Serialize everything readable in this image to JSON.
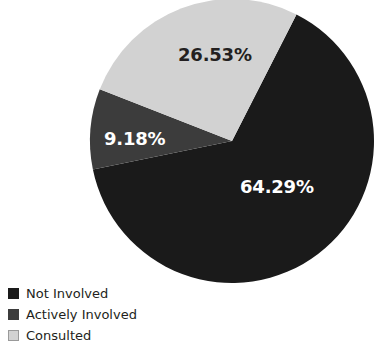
{
  "chart_data": {
    "type": "pie",
    "title": "",
    "subtitle": "",
    "xlabel": "",
    "ylabel": "",
    "grid": false,
    "legend_position": "bottom-left",
    "categories": [
      "Not Involved",
      "Actively Involved",
      "Consulted"
    ],
    "values": [
      64.29,
      9.18,
      26.53
    ],
    "value_unit": "%",
    "data_labels": [
      "64.29%",
      "9.18%",
      "26.53%"
    ],
    "slice_colors": [
      "#1a1a1a",
      "#3c3c3c",
      "#d2d2d2"
    ],
    "label_text_colors": [
      "#ffffff",
      "#ffffff",
      "#231f20"
    ],
    "slices": [
      {
        "name": "Not Involved",
        "value": 64.29,
        "label": "64.29%",
        "color": "#1a1a1a",
        "label_color": "#ffffff",
        "start_angle": 27.0,
        "end_angle": 258.4
      },
      {
        "name": "Actively Involved",
        "value": 9.18,
        "label": "9.18%",
        "color": "#3c3c3c",
        "label_color": "#ffffff",
        "start_angle": 258.4,
        "end_angle": 291.4
      },
      {
        "name": "Consulted",
        "value": 26.53,
        "label": "26.53%",
        "color": "#d2d2d2",
        "label_color": "#231f20",
        "start_angle": 291.4,
        "end_angle": 387.0
      }
    ]
  },
  "legend": {
    "items": [
      {
        "label": "Not Involved",
        "color": "#1a1a1a"
      },
      {
        "label": "Actively Involved",
        "color": "#3c3c3c"
      },
      {
        "label": "Consulted",
        "color": "#d2d2d2"
      }
    ]
  },
  "geometry": {
    "center_x": 232,
    "center_y": 141,
    "radius": 142
  },
  "background_color": "#ffffff"
}
